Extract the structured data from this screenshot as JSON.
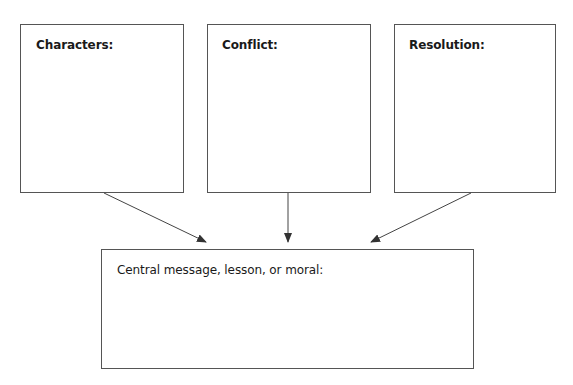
{
  "boxes": {
    "characters": {
      "label": "Characters:"
    },
    "conflict": {
      "label": "Conflict:"
    },
    "resolution": {
      "label": "Resolution:"
    },
    "central": {
      "label": "Central message, lesson, or moral:"
    }
  },
  "colors": {
    "border": "#555555",
    "arrow": "#333333",
    "text": "#1a1a1a"
  }
}
